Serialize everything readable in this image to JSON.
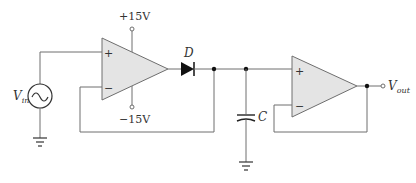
{
  "diagram": {
    "type": "circuit-schematic",
    "components": {
      "source": {
        "label": "V",
        "sub": "in",
        "symbol": "ac-voltage-source"
      },
      "opamp1": {
        "plus": "+",
        "minus": "−",
        "supply_pos": "+15V",
        "supply_neg": "−15V"
      },
      "diode": {
        "label": "D"
      },
      "capacitor": {
        "label": "C"
      },
      "opamp2": {
        "plus": "+",
        "minus": "−"
      },
      "output": {
        "label": "V",
        "sub": "out"
      }
    },
    "colors": {
      "wire": "#6e6e6e",
      "opamp_fill": "#e4e4e4",
      "component": "#111111",
      "text": "#333333"
    }
  }
}
